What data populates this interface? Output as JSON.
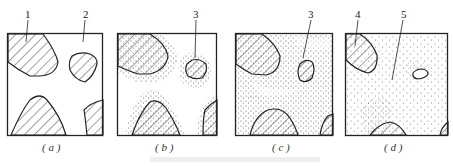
{
  "figure": {
    "panels": [
      {
        "id": "a",
        "label": "( a )"
      },
      {
        "id": "b",
        "label": "( b )"
      },
      {
        "id": "c",
        "label": "( c )"
      },
      {
        "id": "d",
        "label": "( d )"
      }
    ],
    "callouts": {
      "a1": "1",
      "a2": "2",
      "b3": "3",
      "c3": "3",
      "d4": "4",
      "d5": "5"
    },
    "colors": {
      "line": "#222222",
      "hatch": "#444444",
      "dots": "#555555"
    }
  }
}
